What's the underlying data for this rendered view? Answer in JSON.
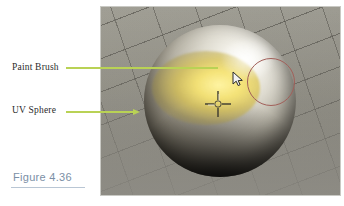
{
  "figure": {
    "caption": "Figure 4.36",
    "caption_color": "#7b8fa6",
    "rule_color": "#b9c6d4"
  },
  "annotations": [
    {
      "id": "paint-brush",
      "label": "Paint Brush",
      "leader_color": "#b9d255",
      "has_arrow": false,
      "points_to": "brush-circle"
    },
    {
      "id": "uv-sphere",
      "label": "UV Sphere",
      "leader_color": "#b9d255",
      "has_arrow": true,
      "points_to": "sphere"
    }
  ],
  "viewport": {
    "name": "3d-viewport",
    "background_color": "#8d8b84",
    "grid_color": "#46443e",
    "objects": [
      {
        "name": "uv-sphere",
        "type": "mesh",
        "shading": "solid",
        "base_color": "#dedbd0",
        "painted_color": "#f6e26a",
        "highlight_color": "#fdfdfa",
        "shadow_color": "#0d0c0a"
      },
      {
        "name": "paint-brush-circle",
        "type": "brush-cursor",
        "outline_color": "#a2605a",
        "radius_px": 24
      },
      {
        "name": "3d-cursor",
        "type": "cursor",
        "color": "#3a382f"
      },
      {
        "name": "mouse-pointer",
        "type": "pointer",
        "fill_color": "#f2f2f2",
        "outline_color": "#2a2a2a"
      }
    ]
  }
}
